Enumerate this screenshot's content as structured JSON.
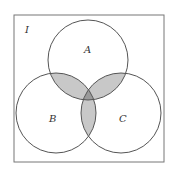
{
  "diagram": {
    "type": "venn",
    "universe_label": "I",
    "sets": [
      {
        "label": "A"
      },
      {
        "label": "B"
      },
      {
        "label": "C"
      }
    ],
    "shaded_regions": [
      "A∩B only",
      "A∩C only",
      "B∩C only",
      "A∩B∩C"
    ],
    "colors": {
      "line": "#555555",
      "pairwise_shade": "#c8c8c8",
      "triple_shade": "#9a9a9a",
      "background": "#ffffff"
    }
  }
}
